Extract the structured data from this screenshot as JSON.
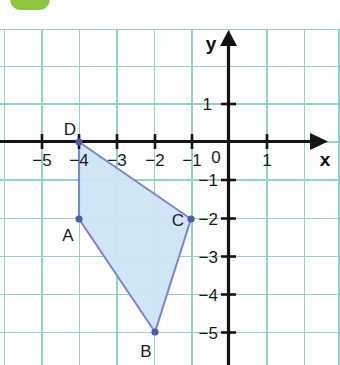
{
  "badge": {
    "name": "green-rounded-badge",
    "color": "#8cc63e"
  },
  "figure": {
    "title": "",
    "type": "coordinate-plane-polygon",
    "axes": {
      "x_label": "x",
      "y_label": "y",
      "origin_label": "0",
      "x_tick_labels": [
        "−5",
        "−4",
        "−3",
        "−2",
        "−1",
        "1"
      ],
      "x_tick_values": [
        -5,
        -4,
        -3,
        -2,
        -1,
        1
      ],
      "y_tick_labels": [
        "1",
        "−1",
        "−2",
        "−3",
        "−4",
        "−5"
      ],
      "y_tick_values": [
        1,
        -1,
        -2,
        -3,
        -4,
        -5
      ],
      "x_range": [
        -5.9,
        2.9
      ],
      "y_range": [
        -5.9,
        2.4
      ],
      "grid": true,
      "grid_color": "#8fd4c4",
      "axis_color": "#141414"
    },
    "polygon": {
      "name": "quadrilateral-ABCD",
      "fill": "#cfe5f4",
      "stroke": "#7e85d4",
      "vertices": [
        {
          "label": "A",
          "x": -4,
          "y": -2,
          "label_pos": "below-left"
        },
        {
          "label": "B",
          "x": -2,
          "y": -5,
          "label_pos": "below-left"
        },
        {
          "label": "C",
          "x": -1,
          "y": -2,
          "label_pos": "left"
        },
        {
          "label": "D",
          "x": -4,
          "y": 0,
          "label_pos": "above-left"
        }
      ]
    }
  }
}
